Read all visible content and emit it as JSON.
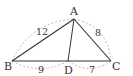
{
  "diagram": {
    "type": "triangle",
    "points": {
      "A": {
        "label": "A",
        "x": 74,
        "y": 19
      },
      "B": {
        "label": "B",
        "x": 12,
        "y": 61
      },
      "C": {
        "label": "C",
        "x": 111,
        "y": 61
      },
      "D": {
        "label": "D",
        "x": 68,
        "y": 61
      }
    },
    "segments": [
      {
        "from": "A",
        "to": "B",
        "length_label": "12"
      },
      {
        "from": "A",
        "to": "C",
        "length_label": "8"
      },
      {
        "from": "B",
        "to": "D",
        "length_label": "9"
      },
      {
        "from": "D",
        "to": "C",
        "length_label": "7"
      },
      {
        "from": "A",
        "to": "D",
        "length_label": ""
      }
    ],
    "colors": {
      "line": "#333333",
      "dashed_arc": "#aaaaaa"
    }
  }
}
